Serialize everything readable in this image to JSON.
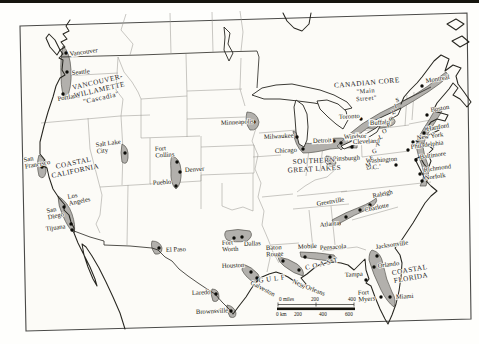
{
  "map": {
    "region_labels": [
      {
        "id": "vancouver-willamette",
        "lines": [
          "VANCOUVER-",
          "WILLAMETTE",
          "\"Cascadia\""
        ],
        "x": 98,
        "y": 84,
        "rot": -13,
        "size": 7.2
      },
      {
        "id": "coastal-california",
        "lines": [
          "COASTAL",
          "CALIFORNIA"
        ],
        "x": 74,
        "y": 165,
        "rot": -12,
        "size": 7.2
      },
      {
        "id": "canadian-core",
        "lines": [
          "CANADIAN CORE"
        ],
        "x": 367,
        "y": 85,
        "rot": -5,
        "size": 7.2
      },
      {
        "id": "main-street",
        "lines": [
          "\"Main",
          "Street\""
        ],
        "x": 366,
        "y": 93,
        "rot": -5,
        "size": 6.4
      },
      {
        "id": "southern-great-lakes",
        "lines": [
          "SOUTHERN",
          "GREAT LAKES"
        ],
        "x": 314,
        "y": 163,
        "rot": -3,
        "size": 7.2
      },
      {
        "id": "gulf",
        "lines": [
          "G U L F"
        ],
        "x": 272,
        "y": 281,
        "rot": -8,
        "size": 7
      },
      {
        "id": "coast",
        "lines": [
          "C O A S T"
        ],
        "x": 322,
        "y": 266,
        "rot": -14,
        "size": 7
      },
      {
        "id": "coastal-florida",
        "lines": [
          "COASTAL",
          "FLORIDA"
        ],
        "x": 410,
        "y": 272,
        "rot": -10,
        "size": 7.2
      }
    ],
    "megalopolis_letters": [
      {
        "ch": "M",
        "x": 369,
        "y": 167
      },
      {
        "ch": "E",
        "x": 372,
        "y": 160
      },
      {
        "ch": "G",
        "x": 375,
        "y": 153
      },
      {
        "ch": "A",
        "x": 378,
        "y": 146
      },
      {
        "ch": "L",
        "x": 381,
        "y": 139
      },
      {
        "ch": "O",
        "x": 385,
        "y": 133
      },
      {
        "ch": "P",
        "x": 389,
        "y": 127
      },
      {
        "ch": "O",
        "x": 392,
        "y": 121
      },
      {
        "ch": "L",
        "x": 394,
        "y": 114
      },
      {
        "ch": "I",
        "x": 396,
        "y": 108
      },
      {
        "ch": "S",
        "x": 398,
        "y": 102
      }
    ],
    "cities": [
      {
        "name": "Vancouver",
        "lines": [
          "Vancouver"
        ],
        "label": [
          70,
          56
        ],
        "rot": -8,
        "dot": [
          66,
          53
        ],
        "boxed": true
      },
      {
        "name": "Seattle",
        "lines": [
          "Seattle"
        ],
        "label": [
          72,
          75
        ],
        "rot": -6,
        "dot": [
          67,
          72
        ]
      },
      {
        "name": "Portland",
        "lines": [
          "Portland"
        ],
        "label": [
          58,
          101
        ],
        "rot": -10,
        "dot": [
          63,
          94
        ]
      },
      {
        "name": "San Francisco",
        "lines": [
          "San",
          "Francisco"
        ],
        "label": [
          24,
          162
        ],
        "rot": -10,
        "dot": [
          42,
          167
        ]
      },
      {
        "name": "Los Angeles",
        "lines": [
          "Los",
          "Angeles"
        ],
        "label": [
          68,
          199
        ],
        "rot": -12,
        "dot": [
          64,
          207
        ]
      },
      {
        "name": "San Diego",
        "lines": [
          "San",
          "Diego"
        ],
        "label": [
          47,
          213
        ],
        "rot": -12,
        "dot": [
          71,
          224
        ]
      },
      {
        "name": "Tijuana",
        "lines": [
          "Tijuana"
        ],
        "label": [
          46,
          231
        ],
        "rot": -8,
        "dot": [
          72,
          230
        ]
      },
      {
        "name": "Salt Lake City",
        "lines": [
          "Salt Lake",
          "City"
        ],
        "label": [
          96,
          147
        ],
        "rot": -8,
        "dot": [
          125,
          153
        ]
      },
      {
        "name": "Fort Collins",
        "lines": [
          "Fort",
          "Collins"
        ],
        "label": [
          155,
          151
        ],
        "rot": -4,
        "dot": [
          177,
          162
        ]
      },
      {
        "name": "Denver",
        "lines": [
          "Denver"
        ],
        "label": [
          185,
          172
        ],
        "rot": -4,
        "dot": [
          180,
          172
        ]
      },
      {
        "name": "Pueblo",
        "lines": [
          "Pueblo"
        ],
        "label": [
          153,
          185
        ],
        "rot": -4,
        "dot": [
          176,
          186
        ]
      },
      {
        "name": "Minneapolis",
        "lines": [
          "Minneapolis"
        ],
        "label": [
          221,
          125
        ],
        "rot": -3,
        "dot": [
          254,
          122
        ]
      },
      {
        "name": "Milwaukee",
        "lines": [
          "Milwaukee"
        ],
        "label": [
          264,
          139
        ],
        "rot": -3,
        "dot": [
          297,
          137
        ]
      },
      {
        "name": "Chicago",
        "lines": [
          "Chicago"
        ],
        "label": [
          275,
          153
        ],
        "rot": -3,
        "dot": [
          303,
          149
        ]
      },
      {
        "name": "Detroit",
        "lines": [
          "Detroit"
        ],
        "label": [
          313,
          143
        ],
        "rot": -3,
        "dot": [
          334,
          141
        ],
        "boxed": true
      },
      {
        "name": "Windsor",
        "lines": [
          "Windsor"
        ],
        "label": [
          344,
          139
        ],
        "rot": -3,
        "dot": [
          341,
          143
        ],
        "boxed": true
      },
      {
        "name": "Cleveland",
        "lines": [
          "Cleveland"
        ],
        "label": [
          353,
          144
        ],
        "rot": -3,
        "dot": [
          352,
          147
        ],
        "boxed": true
      },
      {
        "name": "Pittsburgh",
        "lines": [
          "Pittsburgh"
        ],
        "label": [
          333,
          161
        ],
        "rot": -3,
        "dot": [
          330,
          162
        ]
      },
      {
        "name": "Toronto",
        "lines": [
          "Toronto"
        ],
        "label": [
          339,
          119
        ],
        "rot": -3,
        "dot": [
          361,
          119
        ],
        "boxed": true
      },
      {
        "name": "Buffalo",
        "lines": [
          "Buffalo"
        ],
        "label": [
          370,
          125
        ],
        "rot": -3,
        "dot": [
          383,
          124
        ],
        "boxed": true
      },
      {
        "name": "Montreal",
        "lines": [
          "Montreal"
        ],
        "label": [
          426,
          83
        ],
        "rot": -10,
        "dot": [
          422,
          86
        ]
      },
      {
        "name": "Boston",
        "lines": [
          "Boston"
        ],
        "label": [
          431,
          112
        ],
        "rot": -10,
        "dot": [
          427,
          115
        ]
      },
      {
        "name": "Hartford",
        "lines": [
          "Hartford"
        ],
        "label": [
          427,
          131
        ],
        "rot": -10,
        "dot": [
          424,
          133
        ]
      },
      {
        "name": "New York",
        "lines": [
          "New York"
        ],
        "label": [
          417,
          140
        ],
        "rot": -8,
        "dot": [
          413,
          142
        ]
      },
      {
        "name": "Philadelphia",
        "lines": [
          "Philadelphia"
        ],
        "label": [
          411,
          149
        ],
        "rot": -8,
        "dot": [
          408,
          150
        ]
      },
      {
        "name": "Baltimore",
        "lines": [
          "Baltimore"
        ],
        "label": [
          420,
          159
        ],
        "rot": -8,
        "dot": [
          416,
          160
        ]
      },
      {
        "name": "Washington D.C.",
        "lines": [
          "Washington",
          "D.C.’"
        ],
        "label": [
          366,
          163
        ],
        "rot": -4,
        "dot": [
          396,
          165
        ]
      },
      {
        "name": "Richmond",
        "lines": [
          "Richmond"
        ],
        "label": [
          424,
          172
        ],
        "rot": -8,
        "dot": [
          420,
          174
        ]
      },
      {
        "name": "Norfolk",
        "lines": [
          "Norfolk"
        ],
        "label": [
          425,
          180
        ],
        "rot": -8,
        "dot": [
          422,
          181
        ]
      },
      {
        "name": "Greenville",
        "lines": [
          "Greenville"
        ],
        "label": [
          317,
          206
        ],
        "rot": -10,
        "dot": [
          346,
          217
        ]
      },
      {
        "name": "Raleigh",
        "lines": [
          "Raleigh"
        ],
        "label": [
          373,
          198
        ],
        "rot": -12,
        "dot": [
          370,
          205
        ]
      },
      {
        "name": "Charlotte",
        "lines": [
          "Charlotte"
        ],
        "label": [
          365,
          212
        ],
        "rot": -12,
        "dot": [
          360,
          210
        ]
      },
      {
        "name": "Atlanta",
        "lines": [
          "Atlanta"
        ],
        "label": [
          320,
          227
        ],
        "rot": -6,
        "dot": [
          339,
          224
        ]
      },
      {
        "name": "El Paso",
        "lines": [
          "El Paso"
        ],
        "label": [
          166,
          252
        ],
        "rot": -3,
        "dot": [
          159,
          248
        ]
      },
      {
        "name": "Fort Worth",
        "lines": [
          "Fort",
          "Worth"
        ],
        "label": [
          222,
          245
        ],
        "rot": -3,
        "dot": [
          234,
          238
        ]
      },
      {
        "name": "Dallas",
        "lines": [
          "Dallas"
        ],
        "label": [
          244,
          246
        ],
        "rot": -3,
        "dot": [
          242,
          237
        ]
      },
      {
        "name": "Houston",
        "lines": [
          "Houston"
        ],
        "label": [
          222,
          268
        ],
        "rot": -3,
        "dot": [
          251,
          272
        ]
      },
      {
        "name": "Galveston",
        "lines": [
          "Galveston"
        ],
        "label": [
          250,
          284
        ],
        "rot": 28,
        "dot": [
          257,
          278
        ]
      },
      {
        "name": "Laredo",
        "lines": [
          "Laredo"
        ],
        "label": [
          192,
          295
        ],
        "rot": -3,
        "dot": [
          216,
          294
        ]
      },
      {
        "name": "Brownsville",
        "lines": [
          "Brownsville"
        ],
        "label": [
          196,
          314
        ],
        "rot": -3,
        "dot": [
          231,
          311
        ]
      },
      {
        "name": "Baton Rouge",
        "lines": [
          "Baton",
          "Rouge"
        ],
        "label": [
          266,
          250
        ],
        "rot": -3,
        "dot": [
          283,
          261
        ]
      },
      {
        "name": "New Orleans",
        "lines": [
          "New Orleans"
        ],
        "label": [
          292,
          283
        ],
        "rot": 22,
        "dot": [
          299,
          270
        ]
      },
      {
        "name": "Mobile",
        "lines": [
          "Mobile"
        ],
        "label": [
          298,
          249
        ],
        "rot": -4,
        "dot": [
          305,
          257
        ]
      },
      {
        "name": "Pensacola",
        "lines": [
          "Pensacola"
        ],
        "label": [
          320,
          250
        ],
        "rot": -4,
        "dot": [
          330,
          257
        ]
      },
      {
        "name": "Jacksonville",
        "lines": [
          "Jacksonville"
        ],
        "label": [
          376,
          249
        ],
        "rot": -8,
        "dot": [
          377,
          256
        ]
      },
      {
        "name": "Orlando",
        "lines": [
          "Orlando"
        ],
        "label": [
          378,
          268
        ],
        "rot": -8,
        "dot": [
          374,
          267
        ]
      },
      {
        "name": "Tampa",
        "lines": [
          "Tampa"
        ],
        "label": [
          345,
          277
        ],
        "rot": -4,
        "dot": [
          366,
          280
        ]
      },
      {
        "name": "Fort Myers",
        "lines": [
          "Fort",
          "Myers"
        ],
        "label": [
          358,
          295
        ],
        "rot": -4,
        "dot": [
          381,
          297
        ]
      },
      {
        "name": "Miami",
        "lines": [
          "Miami"
        ],
        "label": [
          396,
          299
        ],
        "rot": -4,
        "dot": [
          390,
          297
        ]
      }
    ],
    "scale_bar": {
      "miles_row": [
        {
          "t": "0 miles",
          "x": 279
        },
        {
          "t": "200",
          "x": 311
        },
        {
          "t": "400",
          "x": 348
        }
      ],
      "km_row": [
        {
          "t": "0 km",
          "x": 276
        },
        {
          "t": "200",
          "x": 294
        },
        {
          "t": "400",
          "x": 319
        },
        {
          "t": "600",
          "x": 345
        }
      ]
    }
  }
}
